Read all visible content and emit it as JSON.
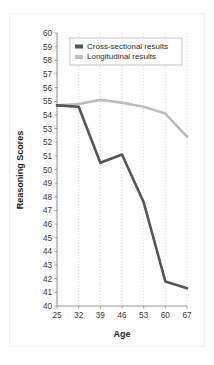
{
  "chart_data": {
    "type": "line",
    "title": "",
    "xlabel": "Age",
    "ylabel": "Reasoning Scores",
    "x": [
      25,
      32,
      39,
      46,
      53,
      60,
      67
    ],
    "categories": [
      "25",
      "32",
      "39",
      "46",
      "53",
      "60",
      "67"
    ],
    "xtick_labels": [
      "25",
      "32",
      "39",
      "46",
      "53",
      "60",
      "67"
    ],
    "ytick_labels": [
      "60",
      "59",
      "58",
      "57",
      "56",
      "55",
      "54",
      "53",
      "52",
      "51",
      "50",
      "49",
      "48",
      "47",
      "46",
      "45",
      "44",
      "43",
      "42",
      "41",
      "40"
    ],
    "ylim": [
      40,
      60
    ],
    "xlim": [
      25,
      67
    ],
    "grid": "vertical-dotted",
    "legend_position": "top-center",
    "series": [
      {
        "name": "Cross-sectional results",
        "color": "#555555",
        "values": [
          54.7,
          54.6,
          50.5,
          51.1,
          47.6,
          41.8,
          41.3
        ]
      },
      {
        "name": "Longitudinal results",
        "color": "#bdbdbd",
        "values": [
          54.7,
          54.8,
          55.1,
          54.9,
          54.6,
          54.1,
          52.4
        ]
      }
    ]
  },
  "legend": {
    "items": [
      {
        "label": "Cross-sectional results",
        "swatch": "#555555"
      },
      {
        "label": "Longitudinal results",
        "swatch": "#bdbdbd"
      }
    ]
  },
  "axes": {
    "y_title": "Reasoning Scores",
    "x_title": "Age"
  }
}
